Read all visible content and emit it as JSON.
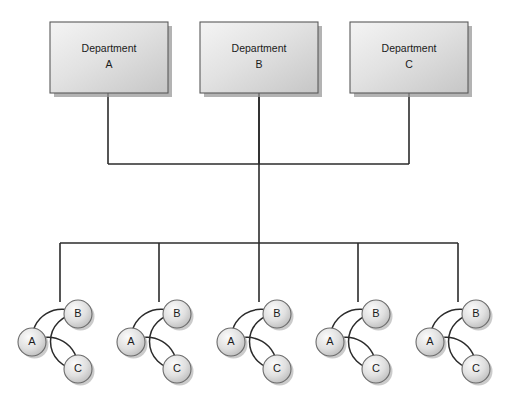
{
  "diagram": {
    "title": "Departmental network topology diagram",
    "canvas": {
      "width": 515,
      "height": 403,
      "background": "#ffffff"
    },
    "colors": {
      "box_fill_light": "#eeeeee",
      "box_fill_dark": "#c9c9c9",
      "box_border": "#5a5a5a",
      "node_fill_light": "#f2f2f2",
      "node_fill_dark": "#c2c2c2",
      "node_border": "#6b6b6b",
      "line": "#2b2b2b",
      "shadow": "#9a9a9a",
      "text": "#1a1a1a"
    },
    "departments": [
      {
        "id": "dept-a",
        "line1": "Department",
        "line2": "A",
        "x": 50,
        "y": 22,
        "w": 118,
        "h": 71,
        "stem_x": 108
      },
      {
        "id": "dept-b",
        "line1": "Department",
        "line2": "B",
        "x": 200,
        "y": 22,
        "w": 118,
        "h": 71,
        "stem_x": 259
      },
      {
        "id": "dept-c",
        "line1": "Department",
        "line2": "C",
        "x": 350,
        "y": 22,
        "w": 118,
        "h": 71,
        "stem_x": 409
      }
    ],
    "upper_bus": {
      "y": 164,
      "x_start": 108,
      "x_end": 409
    },
    "trunk": {
      "x": 259,
      "y_top": 93,
      "y_bottom": 243
    },
    "lower_bus": {
      "y": 243,
      "x_start": 60,
      "x_end": 458
    },
    "clusters": [
      {
        "id": "cluster-1",
        "drop_x": 60,
        "a_cx": 32,
        "a_cy": 342,
        "b_cx": 78,
        "b_cy": 314,
        "c_cx": 78,
        "c_cy": 369
      },
      {
        "id": "cluster-2",
        "drop_x": 159,
        "a_cx": 131,
        "a_cy": 342,
        "b_cx": 177,
        "b_cy": 314,
        "c_cx": 177,
        "c_cy": 369
      },
      {
        "id": "cluster-3",
        "drop_x": 259,
        "a_cx": 231,
        "a_cy": 342,
        "b_cx": 277,
        "b_cy": 314,
        "c_cx": 277,
        "c_cy": 369
      },
      {
        "id": "cluster-4",
        "drop_x": 358,
        "a_cx": 330,
        "a_cy": 342,
        "b_cx": 376,
        "b_cy": 314,
        "c_cx": 376,
        "c_cy": 369
      },
      {
        "id": "cluster-5",
        "drop_x": 458,
        "a_cx": 430,
        "a_cy": 342,
        "b_cx": 476,
        "b_cy": 314,
        "c_cx": 476,
        "c_cy": 369
      }
    ],
    "node_labels": {
      "a": "A",
      "b": "B",
      "c": "C"
    },
    "node_radius": 14
  }
}
